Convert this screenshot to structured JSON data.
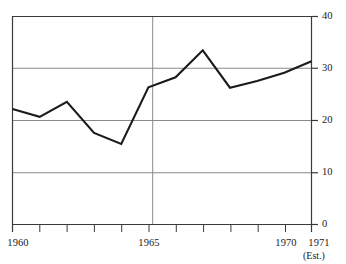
{
  "chart_data": {
    "type": "line",
    "title": "",
    "subtitle": "",
    "xlabel": "",
    "ylabel": "",
    "x": [
      1960,
      1961,
      1962,
      1963,
      1964,
      1965,
      1966,
      1967,
      1968,
      1969,
      1970,
      1971
    ],
    "values": [
      22.2,
      20.7,
      23.6,
      17.6,
      15.5,
      26.4,
      28.3,
      33.5,
      26.3,
      27.6,
      29.2,
      31.4
    ],
    "series": [
      {
        "name": "",
        "values": [
          22.2,
          20.7,
          23.6,
          17.6,
          15.5,
          26.4,
          28.3,
          33.5,
          26.3,
          27.6,
          29.2,
          31.4
        ]
      }
    ],
    "xlim": [
      1960,
      1971
    ],
    "ylim": [
      0,
      40
    ],
    "y_ticks": [
      0,
      10,
      20,
      30,
      40
    ],
    "y_tick_labels": [
      "0",
      "10",
      "20",
      "30",
      "40"
    ],
    "x_ticks": [
      1960,
      1961,
      1962,
      1963,
      1964,
      1965,
      1966,
      1967,
      1968,
      1969,
      1970,
      1971
    ],
    "x_tick_labels_shown": [
      "1960",
      "1965",
      "1970",
      "1971"
    ],
    "x_labeled_ticks": [
      1960,
      1965,
      1970,
      1971
    ],
    "gridlines": {
      "horizontal": [
        10,
        20,
        30
      ],
      "vertical": [
        1965
      ],
      "grid": true
    },
    "annotations": [
      {
        "text": "(Est.)",
        "x": 1971,
        "note": "estimate marker beneath final year label"
      }
    ],
    "axis_position": {
      "y_axis": "right",
      "x_axis": "bottom"
    },
    "legend": {
      "position": "none",
      "entries": []
    },
    "colors": {
      "line": "#1b1b1b",
      "grid": "#8a8a8a",
      "axis": "#3a3a3a",
      "text": "#1b1b1b",
      "background": "#ffffff"
    }
  },
  "axes": {
    "y_labels": [
      {
        "text": "40",
        "value": 40
      },
      {
        "text": "30",
        "value": 30
      },
      {
        "text": "20",
        "value": 20
      },
      {
        "text": "10",
        "value": 10
      },
      {
        "text": "0",
        "value": 0
      }
    ],
    "x_labels": [
      {
        "text": "1960",
        "value": 1960
      },
      {
        "text": "1965",
        "value": 1965
      },
      {
        "text": "1970",
        "value": 1970
      },
      {
        "text": "1971",
        "value": 1971
      }
    ],
    "estimate_note": "(Est.)"
  }
}
